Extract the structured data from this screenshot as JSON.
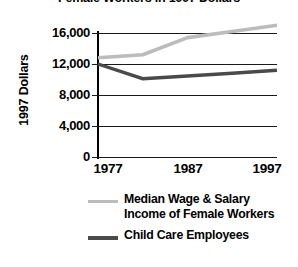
{
  "chart_data": {
    "type": "line",
    "title": "Female Workers in 1997 Dollars",
    "xlabel": "",
    "ylabel": "1997 Dollars",
    "ylim": [
      0,
      18000
    ],
    "xlim": [
      1977,
      1997
    ],
    "grid": true,
    "legend_position": "bottom",
    "ytick_labels": [
      "16,000",
      "12,000",
      "8,000",
      "4,000",
      "0"
    ],
    "yticks": [
      16000,
      12000,
      8000,
      4000,
      0
    ],
    "xtick_labels": [
      "1977",
      "1987",
      "1997"
    ],
    "xticks": [
      1977,
      1987,
      1997
    ],
    "x": [
      1977,
      1982,
      1987,
      1992,
      1997
    ],
    "series": [
      {
        "name": "Median Wage & Salary Income of Female Workers",
        "color": "#bcbcbc",
        "values": [
          12800,
          13200,
          15400,
          16200,
          17000
        ]
      },
      {
        "name": "Child Care Employees",
        "color": "#4a4a4a",
        "values": [
          12000,
          10100,
          10450,
          10800,
          11200
        ]
      }
    ]
  },
  "title": {
    "text": "Female Workers in 1997 Dollars"
  },
  "axes": {
    "y_title": "1997 Dollars",
    "y_ticks": [
      {
        "label": "16,000",
        "value": 16000
      },
      {
        "label": "12,000",
        "value": 12000
      },
      {
        "label": "8,000",
        "value": 8000
      },
      {
        "label": "4,000",
        "value": 4000
      },
      {
        "label": "0",
        "value": 0
      }
    ],
    "x_ticks": [
      {
        "label": "1977",
        "value": 1977
      },
      {
        "label": "1987",
        "value": 1987
      },
      {
        "label": "1997",
        "value": 1997
      }
    ]
  },
  "legend": {
    "entries": [
      {
        "swatch": "light-gray-line",
        "line1": "Median Wage & Salary",
        "line2": "Income of Female Workers",
        "color": "#bcbcbc"
      },
      {
        "swatch": "dark-gray-line",
        "line1": "Child Care Employees",
        "line2": "",
        "color": "#4a4a4a"
      }
    ]
  }
}
